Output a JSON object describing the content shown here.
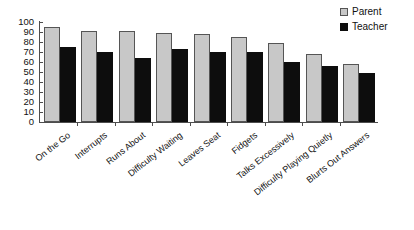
{
  "chart_data": {
    "type": "bar",
    "title": "",
    "subtitle": "",
    "xlabel": "",
    "ylabel": "",
    "ylim": [
      0,
      100
    ],
    "ytick_step": 10,
    "yticks": [
      0,
      10,
      20,
      30,
      40,
      50,
      60,
      70,
      80,
      90,
      100
    ],
    "grid": false,
    "legend_position": "top-right",
    "categories": [
      "On the Go",
      "Interrupts",
      "Runs About",
      "Difficulty Waiting",
      "Leaves Seat",
      "Fidgets",
      "Talks Excessively",
      "Difficulty Playing Quietly",
      "Blurts Out Answers"
    ],
    "series": [
      {
        "name": "Parent",
        "color": "#c8c8c8",
        "values": [
          95,
          91,
          91,
          89,
          88,
          85,
          79,
          68,
          58
        ]
      },
      {
        "name": "Teacher",
        "color": "#0d0d0d",
        "values": [
          75,
          70,
          64,
          73,
          70,
          70,
          60,
          56,
          49
        ]
      }
    ]
  },
  "legend": {
    "items": [
      {
        "label": "Parent",
        "swatch": "parent"
      },
      {
        "label": "Teacher",
        "swatch": "teacher"
      }
    ]
  }
}
